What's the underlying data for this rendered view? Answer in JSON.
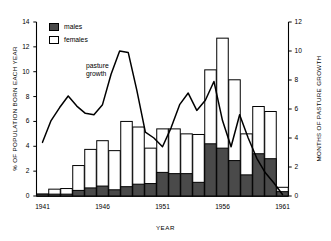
{
  "chart_data": {
    "type": "bar",
    "title": "",
    "xlabel": "YEAR",
    "ylabel": "% OF POPULATION BORN EACH YEAR",
    "ylabel_right": "MONTHS OF PASTURE GROWTH",
    "xlim": [
      1940.5,
      1961.5
    ],
    "ylim": [
      0,
      14
    ],
    "ylim_right": [
      0,
      12
    ],
    "grid": false,
    "legend_position": "top-left",
    "stacked": true,
    "categories": [
      1941,
      1942,
      1943,
      1944,
      1945,
      1946,
      1947,
      1948,
      1949,
      1950,
      1951,
      1952,
      1953,
      1954,
      1955,
      1956,
      1957,
      1958,
      1959,
      1960,
      1961
    ],
    "xticks": [
      1941,
      1946,
      1951,
      1956,
      1961
    ],
    "xtick_labels": [
      "1941",
      "1946",
      "1951",
      "1956",
      "1961"
    ],
    "yticks_left": [
      0,
      2,
      4,
      6,
      8,
      10,
      12,
      14
    ],
    "ytick_labels_left": [
      "0",
      "2",
      "4",
      "6",
      "8",
      "10",
      "12",
      "14"
    ],
    "yticks_right": [
      0,
      2,
      4,
      6,
      8,
      10,
      12
    ],
    "ytick_labels_right": [
      "0",
      "2",
      "4",
      "6",
      "8",
      "10",
      "12"
    ],
    "series": [
      {
        "name": "males",
        "color": "#4a4a4a",
        "values": [
          0.15,
          0.15,
          0.15,
          0.45,
          0.65,
          0.8,
          0.5,
          0.75,
          0.95,
          1.0,
          1.9,
          1.8,
          1.8,
          1.1,
          4.2,
          3.85,
          2.85,
          1.7,
          3.4,
          3.0,
          0.35
        ]
      },
      {
        "name": "females",
        "color": "#ffffff",
        "values": [
          0.0,
          0.4,
          0.45,
          2.0,
          3.1,
          3.65,
          3.15,
          5.25,
          4.6,
          2.85,
          3.5,
          3.6,
          3.2,
          3.85,
          5.95,
          8.85,
          6.5,
          3.3,
          3.8,
          3.8,
          0.35
        ]
      }
    ],
    "totals": [
      0.15,
      0.55,
      0.6,
      2.45,
      3.75,
      4.45,
      3.65,
      6.0,
      5.55,
      3.85,
      5.4,
      5.4,
      5.0,
      4.95,
      10.15,
      12.7,
      9.35,
      5.0,
      7.2,
      6.8,
      0.7
    ],
    "line_series": {
      "name": "pasture growth",
      "axis": "right",
      "color": "#000000",
      "x": [
        1941,
        1942,
        1943,
        1944,
        1945,
        1946,
        1947,
        1948,
        1949,
        1950,
        1951,
        1952,
        1953,
        1954,
        1955,
        1956,
        1957,
        1958,
        1959,
        1960,
        1961
      ],
      "values": [
        3.7,
        5.2,
        6.1,
        6.9,
        6.2,
        5.7,
        5.6,
        6.3,
        8.4,
        10.0,
        9.9,
        7.3,
        4.4,
        4.0,
        3.4,
        4.7,
        6.3,
        7.1,
        5.9,
        6.6,
        7.9,
        5.2,
        3.4,
        5.6,
        4.0,
        2.6,
        1.6,
        0.9,
        0.1
      ]
    }
  },
  "legend": {
    "items": [
      {
        "label": "males",
        "swatch": "filled"
      },
      {
        "label": "females",
        "swatch": "open"
      }
    ]
  },
  "annotations": {
    "pasture_growth_line1": "pasture",
    "pasture_growth_line2": "growth"
  },
  "colors": {
    "males_fill": "#4a4a4a",
    "females_fill": "#ffffff",
    "line": "#000000",
    "axis": "#000000",
    "background": "#ffffff"
  }
}
